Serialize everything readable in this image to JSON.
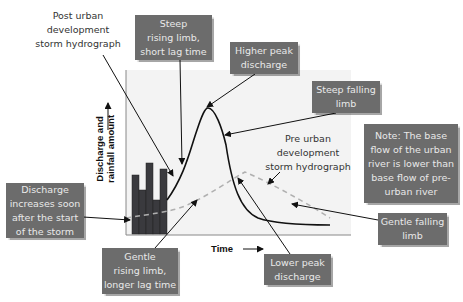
{
  "diagram": {
    "labels": {
      "post_urban": "Post urban\ndevelopment\nstorm hydrograph",
      "pre_urban": "Pre urban\ndevelopment\nstorm hydrograph",
      "steep_rising": "Steep\nrising limb,\nshort lag time",
      "higher_peak": "Higher peak\ndischarge",
      "steep_falling": "Steep falling\nlimb",
      "note": "Note: The base\nflow of the urban\nriver is lower than\nbase flow of pre-\nurban river",
      "discharge_increases": "Discharge\nincreases soon\nafter the start\nof the storm",
      "gentle_rising": "Gentle\nrising limb,\nlonger lag time",
      "gentle_falling": "Gentle falling\nlimb",
      "lower_peak": "Lower peak\ndischarge"
    },
    "axes": {
      "x_label": "Time",
      "y_label": "Discharge and\nrainfall amount"
    },
    "colors": {
      "box_fill": "#6c6c6c",
      "box_text": "#e9e9e9",
      "bar_fill": "#3a3a3e",
      "chart_bg": "#f3f3f3",
      "pre_urban_curve": "#b0b0b0",
      "post_urban_curve": "#111111"
    },
    "rainfall_bars": {
      "count": 5,
      "relative_heights": [
        59,
        44,
        71,
        34,
        65
      ]
    }
  }
}
